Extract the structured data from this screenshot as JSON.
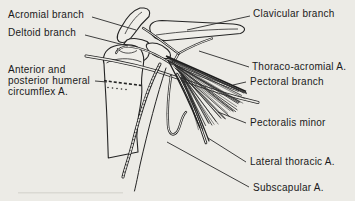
{
  "figure": {
    "type": "anatomical-line-diagram",
    "colors": {
      "paper": "#ecebe6",
      "ink": "#1f1f1f"
    },
    "labels": {
      "acromial_branch": "Acromial branch",
      "deltoid_branch": "Deltoid branch",
      "circumflex_line1": "Anterior and",
      "circumflex_line2": "posterior humeral",
      "circumflex_line3": "circumflex A.",
      "clavicular_branch": "Clavicular branch",
      "thoraco_acromial": "Thoraco-acromial A.",
      "pectoral_branch": "Pectoral branch",
      "pectoralis_minor": "Pectoralis minor",
      "lateral_thoracic": "Lateral thoracic A.",
      "subscapular": "Subscapular A."
    }
  }
}
